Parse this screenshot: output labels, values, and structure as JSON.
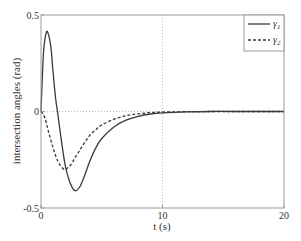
{
  "chart_data": {
    "type": "line",
    "title": "",
    "xlabel": "t (s)",
    "ylabel": "intersection angles (rad)",
    "xlim": [
      0,
      20
    ],
    "ylim": [
      -0.5,
      0.5
    ],
    "xticks": [
      "0",
      "10",
      "20"
    ],
    "yticks": [
      "0.5",
      "0",
      "-0.5"
    ],
    "grid": "dotted lines at x=10 and y=0",
    "legend_position": "upper right",
    "series": [
      {
        "name": "γ1",
        "style": "solid",
        "x": [
          0,
          0.2,
          0.4,
          0.55,
          0.8,
          1.0,
          1.2,
          1.4,
          1.7,
          2.0,
          2.4,
          2.8,
          3.2,
          3.6,
          4.0,
          4.5,
          5.0,
          6.0,
          7.0,
          8.0,
          9.0,
          10.0,
          12.0,
          14.0,
          16.0,
          20.0
        ],
        "y": [
          0,
          0.3,
          0.4,
          0.41,
          0.34,
          0.2,
          0.07,
          -0.02,
          -0.16,
          -0.28,
          -0.37,
          -0.41,
          -0.39,
          -0.33,
          -0.26,
          -0.19,
          -0.14,
          -0.08,
          -0.045,
          -0.025,
          -0.013,
          -0.007,
          -0.002,
          0,
          0,
          0
        ]
      },
      {
        "name": "γ2",
        "style": "dashed",
        "x": [
          0,
          0.3,
          0.6,
          1.0,
          1.4,
          1.8,
          2.0,
          2.4,
          2.8,
          3.2,
          3.6,
          4.0,
          4.5,
          5.0,
          6.0,
          7.0,
          8.0,
          9.0,
          10.0,
          12.0,
          14.0,
          16.0,
          20.0
        ],
        "y": [
          0,
          -0.03,
          -0.1,
          -0.19,
          -0.26,
          -0.295,
          -0.3,
          -0.28,
          -0.24,
          -0.2,
          -0.16,
          -0.125,
          -0.095,
          -0.07,
          -0.04,
          -0.022,
          -0.012,
          -0.006,
          -0.003,
          -0.001,
          0,
          0,
          0
        ]
      }
    ]
  },
  "legend": {
    "items": [
      {
        "label": "γ1",
        "sym": "γ",
        "sub": "1",
        "style": "solid"
      },
      {
        "label": "γ2",
        "sym": "γ",
        "sub": "2",
        "style": "dashed"
      }
    ]
  },
  "colors": {
    "line": "#3a3a3a",
    "axis": "#999999",
    "grid": "#aaaaaa",
    "text": "#333333"
  }
}
